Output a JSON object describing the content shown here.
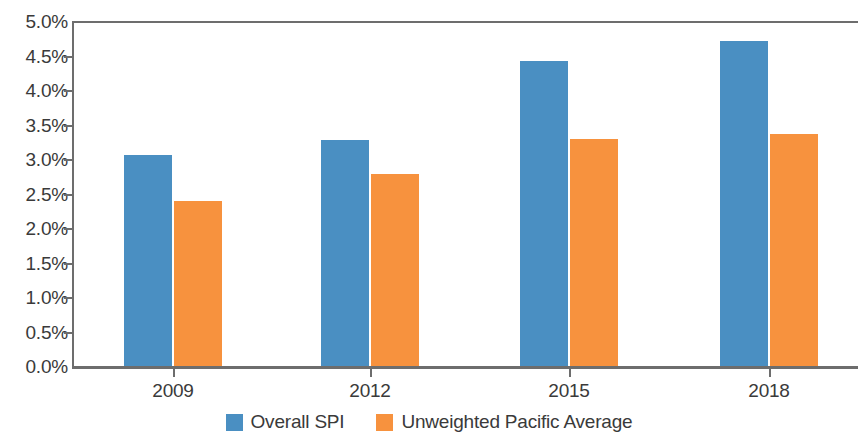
{
  "chart_data": {
    "type": "bar",
    "title": "",
    "subtitle": "",
    "xlabel": "",
    "ylabel": "",
    "categories": [
      "2009",
      "2012",
      "2015",
      "2018"
    ],
    "series": [
      {
        "name": "Overall SPI",
        "color": "#4a8fc2",
        "values": [
          3.07,
          3.29,
          4.43,
          4.72
        ]
      },
      {
        "name": "Unweighted Pacific Average",
        "color": "#f7923e",
        "values": [
          2.4,
          2.8,
          3.31,
          3.37
        ]
      }
    ],
    "ylim": [
      0,
      5
    ],
    "y_tick_step": 0.5,
    "y_tick_labels": [
      "5.0%",
      "4.5%",
      "4.0%",
      "3.5%",
      "3.0%",
      "2.5%",
      "2.0%",
      "1.5%",
      "1.0%",
      "0.5%",
      "0.0%"
    ],
    "y_tick_values": [
      5.0,
      4.5,
      4.0,
      3.5,
      3.0,
      2.5,
      2.0,
      1.5,
      1.0,
      0.5,
      0.0
    ],
    "value_suffix": "%",
    "grid": false,
    "legend_position": "bottom",
    "axis_color": "#6d6d6d"
  },
  "legend": {
    "items": [
      {
        "label": "Overall SPI",
        "swatch": "blue"
      },
      {
        "label": "Unweighted Pacific Average",
        "swatch": "orange"
      }
    ]
  }
}
